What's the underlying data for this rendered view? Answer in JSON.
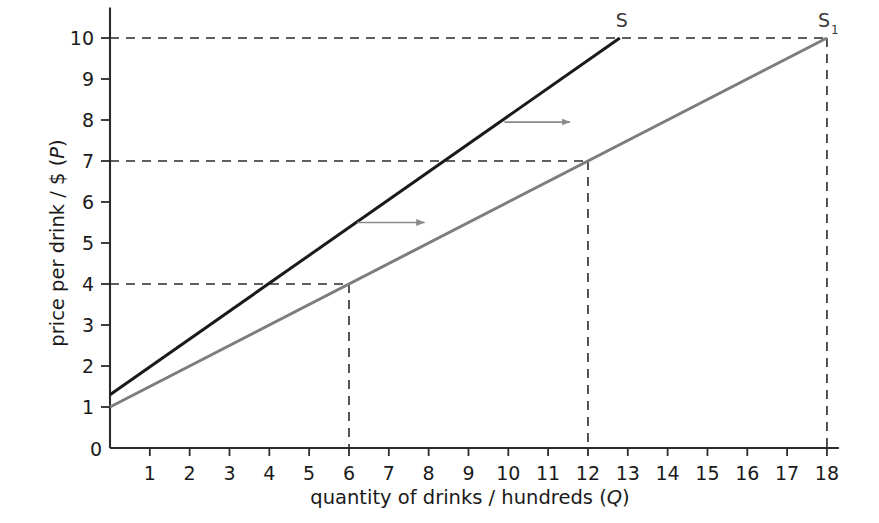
{
  "chart_data": {
    "type": "line",
    "title": "",
    "xlabel": "quantity of drinks / hundreds (Q)",
    "ylabel": "price per drink / $ (P)",
    "xlabel_main": "quantity of drinks / hundreds (",
    "xlabel_var": "Q",
    "xlabel_close": ")",
    "ylabel_main": "price per drink / $ (",
    "ylabel_var": "P",
    "ylabel_close": ")",
    "xlim": [
      0,
      18.3
    ],
    "ylim": [
      0,
      10.6
    ],
    "grid": false,
    "legend_position": "inline-endpoint-labels",
    "x_ticks": [
      1,
      2,
      3,
      4,
      5,
      6,
      7,
      8,
      9,
      10,
      11,
      12,
      13,
      14,
      15,
      16,
      17,
      18
    ],
    "x_tick_labels": [
      "1",
      "2",
      "3",
      "4",
      "5",
      "6",
      "7",
      "8",
      "9",
      "10",
      "11",
      "12",
      "13",
      "14",
      "15",
      "16",
      "17",
      "18"
    ],
    "y_ticks": [
      1,
      2,
      3,
      4,
      5,
      6,
      7,
      8,
      9,
      10
    ],
    "y_tick_labels": [
      "1",
      "2",
      "3",
      "4",
      "5",
      "6",
      "7",
      "8",
      "9",
      "10"
    ],
    "origin_label": "0",
    "series": [
      {
        "name": "S",
        "label": "S",
        "sublabel": "",
        "color": "#1a1a1a",
        "width": 3.0,
        "points": [
          [
            0,
            1.3
          ],
          [
            12.8,
            10
          ]
        ],
        "note": "original supply curve"
      },
      {
        "name": "S1",
        "label": "S",
        "sublabel": "1",
        "color": "#7d7d7d",
        "width": 3.0,
        "points": [
          [
            0,
            1.0
          ],
          [
            18,
            10
          ]
        ],
        "note": "shifted supply curve"
      }
    ],
    "guide_lines": [
      {
        "name": "p10-horizontal",
        "type": "h",
        "value": 10,
        "from_x": 0,
        "to_x": 18
      },
      {
        "name": "p7-horizontal",
        "type": "h",
        "value": 7,
        "from_x": 0,
        "to_x": 12
      },
      {
        "name": "p4-horizontal",
        "type": "h",
        "value": 4,
        "from_x": 0,
        "to_x": 6
      },
      {
        "name": "q18-vertical",
        "type": "v",
        "value": 18,
        "from_y": 0,
        "to_y": 10
      },
      {
        "name": "q12-vertical",
        "type": "v",
        "value": 12,
        "from_y": 0,
        "to_y": 7
      },
      {
        "name": "q6-vertical",
        "type": "v",
        "value": 6,
        "from_y": 0,
        "to_y": 4
      }
    ],
    "annotations": [
      {
        "name": "shift-arrow-upper",
        "type": "arrow",
        "x1": 9.9,
        "y1": 7.95,
        "x2": 11.55,
        "y2": 7.95,
        "color": "#8a8a8a"
      },
      {
        "name": "shift-arrow-lower",
        "type": "arrow",
        "x1": 6.2,
        "y1": 5.5,
        "x2": 7.9,
        "y2": 5.5,
        "color": "#8a8a8a"
      }
    ],
    "colors": {
      "axis": "#2b2b2b",
      "dashed": "#2b2b2b",
      "supply_original": "#1a1a1a",
      "supply_shifted": "#7d7d7d",
      "arrow": "#8a8a8a",
      "background": "#ffffff"
    }
  }
}
